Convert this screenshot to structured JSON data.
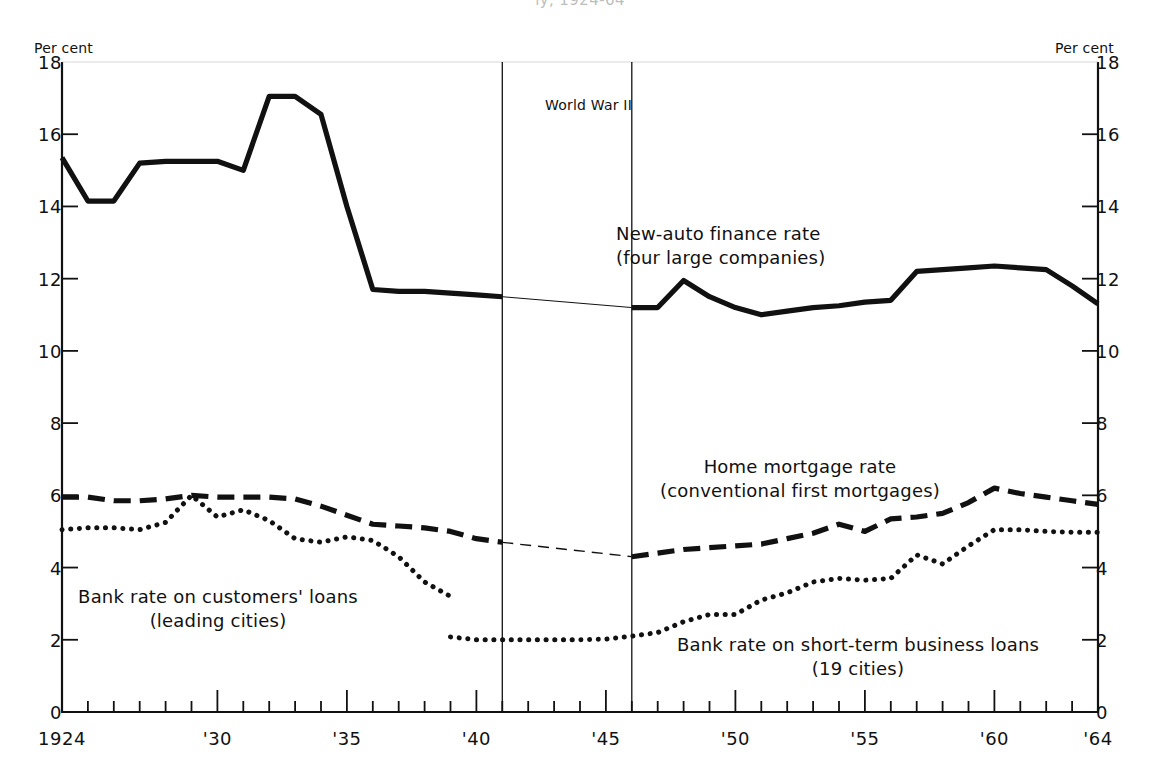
{
  "figure": {
    "clipped_title": "ly, 1924-64",
    "left_unit_label": "Per cent",
    "right_unit_label": "Per cent"
  },
  "annotations": {
    "world_war_2": "World War II",
    "new_auto_line1": "New-auto finance rate",
    "new_auto_line2": "(four large companies)",
    "home_mortgage_line1": "Home mortgage rate",
    "home_mortgage_line2": "(conventional first mortgages)",
    "customers_loans_line1": "Bank rate on customers' loans",
    "customers_loans_line2": "(leading cities)",
    "short_term_line1": "Bank rate on short-term business loans",
    "short_term_line2": "(19 cities)"
  },
  "chart_data": {
    "type": "line",
    "title": "",
    "xlabel": "",
    "ylabel": "Per cent",
    "xlim": [
      1924,
      1964
    ],
    "ylim": [
      0,
      18
    ],
    "ytick_values": [
      0,
      2,
      4,
      6,
      8,
      10,
      12,
      14,
      16,
      18
    ],
    "ytick_labels": [
      "0",
      "2",
      "4",
      "6",
      "8",
      "10",
      "12",
      "14",
      "16",
      "18"
    ],
    "xtick_values": [
      1924,
      1930,
      1935,
      1940,
      1945,
      1950,
      1955,
      1960,
      1964
    ],
    "xtick_labels": [
      "1924",
      "'30",
      "'35",
      "'40",
      "'45",
      "'50",
      "'55",
      "'60",
      "'64"
    ],
    "xtick_minor_step": 1,
    "grid": false,
    "legend": "annotations-inline",
    "shaded_band": {
      "label": "World War II",
      "start": 1941,
      "end": 1946
    },
    "series": [
      {
        "name": "New-auto finance rate (four large companies)",
        "style": "solid-thick",
        "color": "#111111",
        "segments": [
          {
            "x": [
              1924,
              1925,
              1926,
              1927,
              1928,
              1929,
              1930,
              1931,
              1932,
              1933,
              1934,
              1935,
              1936,
              1937,
              1938,
              1939,
              1940,
              1941
            ],
            "y": [
              15.35,
              14.15,
              14.15,
              15.2,
              15.25,
              15.25,
              15.25,
              15.0,
              17.05,
              17.05,
              16.55,
              14.0,
              11.7,
              11.65,
              11.65,
              11.6,
              11.55,
              11.5
            ]
          },
          {
            "x": [
              1946,
              1947,
              1948,
              1949,
              1950,
              1951,
              1952,
              1953,
              1954,
              1955,
              1956,
              1957,
              1958,
              1959,
              1960,
              1961,
              1962,
              1963,
              1964
            ],
            "y": [
              11.2,
              11.2,
              11.95,
              11.5,
              11.2,
              11.0,
              11.1,
              11.2,
              11.25,
              11.35,
              11.4,
              12.2,
              12.25,
              12.3,
              12.35,
              12.3,
              12.25,
              11.8,
              11.3
            ]
          }
        ],
        "bridge": {
          "x": [
            1941,
            1946
          ],
          "y": [
            11.5,
            11.2
          ],
          "style": "thin-solid"
        }
      },
      {
        "name": "Home mortgage rate (conventional first mortgages)",
        "style": "dashed-thick",
        "color": "#111111",
        "segments": [
          {
            "x": [
              1924,
              1925,
              1926,
              1927,
              1928,
              1929,
              1930,
              1931,
              1932,
              1933,
              1934,
              1935,
              1936,
              1937,
              1938,
              1939,
              1940,
              1941
            ],
            "y": [
              5.95,
              5.95,
              5.85,
              5.85,
              5.9,
              6.0,
              5.95,
              5.95,
              5.95,
              5.9,
              5.7,
              5.45,
              5.2,
              5.15,
              5.1,
              5.0,
              4.8,
              4.7
            ]
          },
          {
            "x": [
              1946,
              1947,
              1948,
              1949,
              1950,
              1951,
              1952,
              1953,
              1954,
              1955,
              1956,
              1957,
              1958,
              1959,
              1960,
              1961,
              1962,
              1963,
              1964
            ],
            "y": [
              4.3,
              4.4,
              4.5,
              4.55,
              4.6,
              4.65,
              4.8,
              4.95,
              5.2,
              5.0,
              5.35,
              5.4,
              5.5,
              5.8,
              6.2,
              6.05,
              5.95,
              5.85,
              5.75
            ]
          }
        ],
        "bridge": {
          "x": [
            1941,
            1946
          ],
          "y": [
            4.7,
            4.3
          ],
          "style": "thin-dashed"
        }
      },
      {
        "name": "Bank rate on customers' loans (leading cities)",
        "style": "dotted",
        "color": "#111111",
        "segments": [
          {
            "x": [
              1924,
              1925,
              1926,
              1927,
              1928,
              1929,
              1930,
              1931,
              1932,
              1933,
              1934,
              1935,
              1936,
              1937,
              1938,
              1939
            ],
            "y": [
              5.05,
              5.1,
              5.1,
              5.05,
              5.25,
              6.0,
              5.4,
              5.6,
              5.3,
              4.8,
              4.7,
              4.85,
              4.75,
              4.3,
              3.6,
              3.2
            ]
          }
        ]
      },
      {
        "name": "Bank rate on short-term business loans (19 cities)",
        "style": "dotted",
        "color": "#111111",
        "segments": [
          {
            "x": [
              1939,
              1940,
              1941,
              1942,
              1943,
              1944,
              1945,
              1946,
              1947,
              1948,
              1949,
              1950,
              1951,
              1952,
              1953,
              1954,
              1955,
              1956,
              1957,
              1958,
              1959,
              1960,
              1961,
              1962,
              1963,
              1964
            ],
            "y": [
              2.08,
              2.0,
              2.0,
              2.0,
              2.0,
              2.0,
              2.02,
              2.1,
              2.2,
              2.5,
              2.7,
              2.7,
              3.1,
              3.3,
              3.6,
              3.7,
              3.65,
              3.7,
              4.35,
              4.1,
              4.6,
              5.05,
              5.05,
              5.0,
              4.98,
              4.98
            ]
          }
        ]
      }
    ]
  }
}
